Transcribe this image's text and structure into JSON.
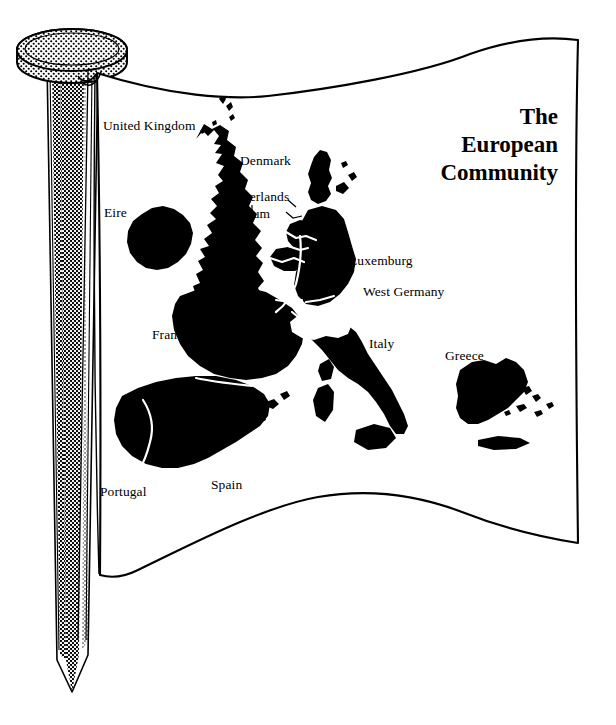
{
  "illustration": {
    "type": "line-drawing",
    "subject": "flag-of-the-european-community-on-a-nail-pole",
    "background_color": "#ffffff",
    "ink_color": "#000000"
  },
  "flag": {
    "title_lines": [
      "The",
      "European",
      "Community"
    ],
    "title_full": "The European Community",
    "fabric_color": "#ffffff",
    "outline_color": "#000000"
  },
  "pole": {
    "name": "nail-flagpole",
    "head_shape": "ellipse-disc",
    "shading": "halftone-dots",
    "tip": "pointed"
  },
  "map": {
    "name": "european-community-member-states-map",
    "landmass_color": "#000000",
    "border_color": "#ffffff",
    "labels": [
      {
        "id": "united-kingdom",
        "text": "United Kingdom",
        "x": 103,
        "y": 118
      },
      {
        "id": "denmark",
        "text": "Denmark",
        "x": 240,
        "y": 153
      },
      {
        "id": "netherlands",
        "text": "Netherlands",
        "x": 223,
        "y": 189
      },
      {
        "id": "belgium",
        "text": "Belgium",
        "x": 223,
        "y": 206
      },
      {
        "id": "eire",
        "text": "Eire",
        "x": 104,
        "y": 205
      },
      {
        "id": "luxemburg",
        "text": "Luxemburg",
        "x": 349,
        "y": 253
      },
      {
        "id": "west-germany",
        "text": "West Germany",
        "x": 363,
        "y": 284
      },
      {
        "id": "france",
        "text": "France",
        "x": 152,
        "y": 327
      },
      {
        "id": "italy",
        "text": "Italy",
        "x": 369,
        "y": 336
      },
      {
        "id": "greece",
        "text": "Greece",
        "x": 445,
        "y": 348
      },
      {
        "id": "spain",
        "text": "Spain",
        "x": 211,
        "y": 477
      },
      {
        "id": "portugal",
        "text": "Portugal",
        "x": 100,
        "y": 484
      }
    ]
  }
}
